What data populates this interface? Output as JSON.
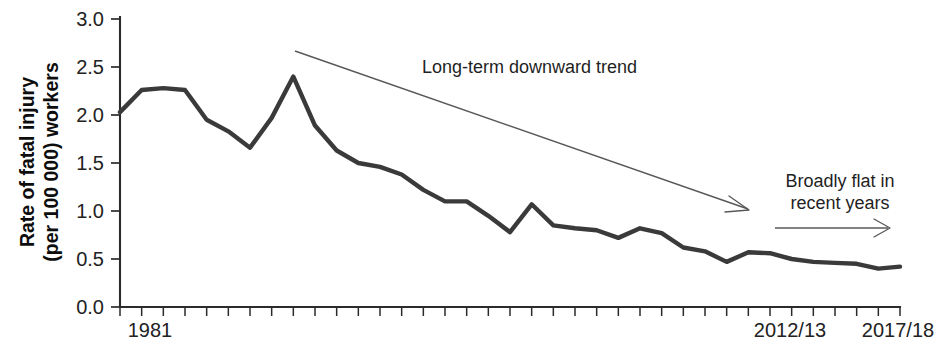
{
  "chart_data": {
    "type": "line",
    "title": "",
    "xlabel": "",
    "ylabel": "Rate of fatal injury (per 100 000) workers",
    "ylabel_line1": "Rate of fatal injury",
    "ylabel_line2": "(per 100 000) workers",
    "ylim": [
      0.0,
      3.0
    ],
    "ytick_values": [
      0.0,
      0.5,
      1.0,
      1.5,
      2.0,
      2.5,
      3.0
    ],
    "ytick_labels": [
      "0.0",
      "0.5",
      "1.0",
      "1.5",
      "2.0",
      "2.5",
      "3.0"
    ],
    "xtick_labels_shown": [
      "1981",
      "2012/13",
      "2017/18"
    ],
    "x_minor_tick_count": 37,
    "grid": false,
    "legend": null,
    "series": [
      {
        "name": "Rate of fatal injury to workers",
        "color": "#3a3a3a",
        "x": [
          "1981",
          "1982",
          "1983",
          "1984",
          "1985",
          "1986",
          "1987",
          "1988",
          "1989",
          "1990",
          "1991",
          "1992",
          "1993",
          "1994",
          "1995/96",
          "1996/97",
          "1997/98",
          "1998/99",
          "1999/00",
          "2000/01",
          "2001/02",
          "2002/03",
          "2003/04",
          "2004/05",
          "2005/06",
          "2006/07",
          "2007/08",
          "2008/09",
          "2009/10",
          "2010/11",
          "2011/12",
          "2012/13",
          "2013/14",
          "2014/15",
          "2015/16",
          "2016/17",
          "2017/18"
        ],
        "values": [
          2.03,
          2.26,
          2.28,
          2.26,
          1.95,
          1.83,
          1.66,
          1.97,
          2.4,
          1.89,
          1.63,
          1.5,
          1.46,
          1.38,
          1.22,
          1.1,
          1.1,
          0.95,
          0.78,
          1.07,
          0.85,
          0.82,
          0.8,
          0.72,
          0.82,
          0.77,
          0.62,
          0.58,
          0.47,
          0.57,
          0.56,
          0.5,
          0.47,
          0.46,
          0.45,
          0.4,
          0.42
        ]
      }
    ],
    "annotations": [
      {
        "id": "long-term-trend",
        "text": "Long-term downward trend",
        "arrow": "diagonal-down-right"
      },
      {
        "id": "broadly-flat",
        "text": "Broadly flat in recent years",
        "text_line1": "Broadly flat in",
        "text_line2": "recent years",
        "arrow": "horizontal-right"
      }
    ]
  },
  "colors": {
    "line": "#3a3a3a",
    "axis": "#2b2b2b",
    "annotation": "#585858",
    "text": "#1f1f1f",
    "background": "#ffffff"
  }
}
